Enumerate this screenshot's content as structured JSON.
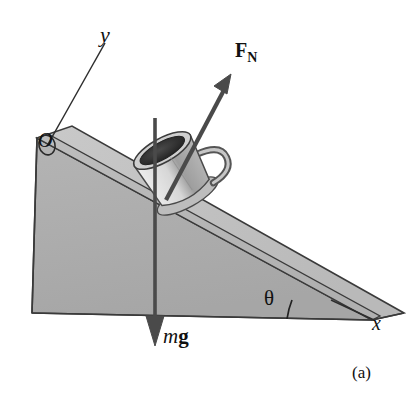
{
  "figure": {
    "panel_label": "(a)",
    "caption_alt": "Cup of coffee resting on an inclined plane with normal force and weight vectors",
    "background_color": "#ffffff",
    "ink_color": "#111111"
  },
  "labels": {
    "y_axis": "y",
    "x_axis": "x",
    "origin": "O",
    "angle": "θ",
    "normal_force_symbol": "F",
    "normal_force_subscript": "N",
    "weight_mass_symbol": "m",
    "weight_gravity_symbol": "g"
  },
  "colors": {
    "incline_side_face": "#aeaeae",
    "incline_top_face": "#b8b8b8",
    "incline_top_band": "#c4c4c4",
    "incline_edge_dark": "#3a3a3a",
    "cup_body_light": "#d9d9d9",
    "cup_body_shade": "#a9a9a9",
    "cup_rim": "#c8c8c8",
    "coffee_dark": "#2b2b2b",
    "saucer": "#bdbdbd",
    "arrow": "#4a4a4a",
    "axis_line": "#2d2d2d"
  },
  "vectors": [
    {
      "name": "normal-force",
      "label": "F_N",
      "direction": "perpendicular to incline surface, up and to the right",
      "tail": [
        168,
        196
      ],
      "tip": [
        229,
        79
      ]
    },
    {
      "name": "weight",
      "label": "mg",
      "direction": "straight down (vertical)",
      "tail": [
        155,
        118
      ],
      "tip": [
        155,
        344
      ]
    }
  ],
  "axes": [
    {
      "name": "y-axis",
      "label": "y",
      "from": [
        47,
        145
      ],
      "to": [
        104,
        44
      ]
    },
    {
      "name": "x-axis",
      "label": "x",
      "from": [
        330,
        300
      ],
      "to": [
        373,
        320
      ]
    }
  ],
  "geometry": {
    "incline_apex_top_left": [
      37,
      138
    ],
    "incline_tip_bottom_right": [
      372,
      320
    ],
    "incline_base_left": [
      32,
      313
    ],
    "angle_arc_center": [
      372,
      320
    ],
    "angle_degrees_approx": 28
  }
}
